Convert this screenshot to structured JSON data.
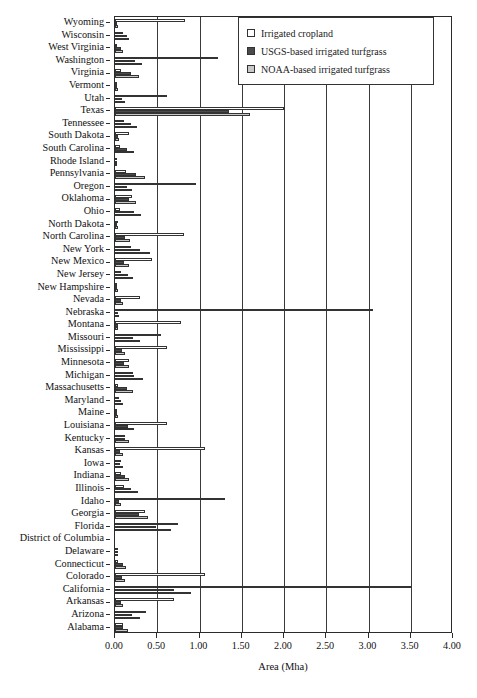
{
  "chart_data": {
    "type": "bar",
    "orientation": "horizontal",
    "title": "",
    "xlabel": "Area (Mha)",
    "ylabel": "",
    "xlim": [
      0.0,
      4.0
    ],
    "xticks": [
      "0.00",
      "0.50",
      "1.00",
      "1.50",
      "2.00",
      "2.50",
      "3.00",
      "3.50",
      "4.00"
    ],
    "grid": true,
    "legend_position": "top-right",
    "series": [
      {
        "name": "Irrigated cropland",
        "color": "#ffffff",
        "values": [
          0.83,
          0.1,
          0.01,
          1.22,
          0.07,
          0.01,
          0.61,
          2.0,
          0.11,
          0.16,
          0.06,
          0.01,
          0.13,
          0.96,
          0.2,
          0.06,
          0.03,
          0.82,
          0.19,
          0.44,
          0.07,
          0.02,
          0.29,
          3.05,
          0.78,
          0.55,
          0.61,
          0.17,
          0.21,
          0.03,
          0.05,
          0.02,
          0.61,
          0.12,
          1.07,
          0.07,
          0.07,
          0.11,
          1.3,
          0.36,
          0.74,
          0.0,
          0.03,
          0.03,
          1.07,
          3.5,
          0.7,
          0.37,
          0.09
        ]
      },
      {
        "name": "USGS-based irrigated turfgrass",
        "color": "#4a4a4a",
        "values": [
          0.02,
          0.14,
          0.07,
          0.24,
          0.19,
          0.02,
          0.08,
          1.35,
          0.19,
          0.04,
          0.14,
          0.01,
          0.25,
          0.14,
          0.17,
          0.22,
          0.02,
          0.12,
          0.29,
          0.11,
          0.15,
          0.02,
          0.07,
          0.03,
          0.03,
          0.21,
          0.08,
          0.11,
          0.22,
          0.14,
          0.07,
          0.02,
          0.15,
          0.12,
          0.06,
          0.06,
          0.12,
          0.19,
          0.05,
          0.28,
          0.48,
          0.0,
          0.03,
          0.09,
          0.08,
          0.7,
          0.07,
          0.2,
          0.1
        ]
      },
      {
        "name": "NOAA-based irrigated turfgrass",
        "color": "#c8c8c8",
        "values": [
          0.03,
          0.17,
          0.1,
          0.32,
          0.28,
          0.03,
          0.12,
          1.6,
          0.26,
          0.05,
          0.23,
          0.01,
          0.36,
          0.2,
          0.25,
          0.31,
          0.03,
          0.18,
          0.41,
          0.16,
          0.21,
          0.03,
          0.1,
          0.05,
          0.04,
          0.3,
          0.12,
          0.16,
          0.33,
          0.21,
          0.1,
          0.03,
          0.22,
          0.17,
          0.09,
          0.09,
          0.17,
          0.27,
          0.07,
          0.39,
          0.66,
          0.0,
          0.04,
          0.13,
          0.12,
          0.9,
          0.1,
          0.29,
          0.15
        ]
      }
    ],
    "categories": [
      "Wyoming",
      "Wisconsin",
      "West Virginia",
      "Washington",
      "Virginia",
      "Vermont",
      "Utah",
      "Texas",
      "Tennessee",
      "South Dakota",
      "South Carolina",
      "Rhode Island",
      "Pennsylvania",
      "Oregon",
      "Oklahoma",
      "Ohio",
      "North Dakota",
      "North Carolina",
      "New York",
      "New Mexico",
      "New Jersey",
      "New Hampshire",
      "Nevada",
      "Nebraska",
      "Montana",
      "Missouri",
      "Mississippi",
      "Minnesota",
      "Michigan",
      "Massachusetts",
      "Maryland",
      "Maine",
      "Louisiana",
      "Kentucky",
      "Kansas",
      "Iowa",
      "Indiana",
      "Illinois",
      "Idaho",
      "Georgia",
      "Florida",
      "District of Columbia",
      "Delaware",
      "Connecticut",
      "Colorado",
      "California",
      "Arkansas",
      "Arizona",
      "Alabama"
    ]
  },
  "legend": {
    "items": [
      {
        "label": "Irrigated cropland",
        "swatch": "cropland"
      },
      {
        "label": "USGS-based irrigated turfgrass",
        "swatch": "usgs"
      },
      {
        "label": "NOAA-based irrigated turfgrass",
        "swatch": "noaa"
      }
    ]
  },
  "axis": {
    "x_title": "Area (Mha)"
  }
}
